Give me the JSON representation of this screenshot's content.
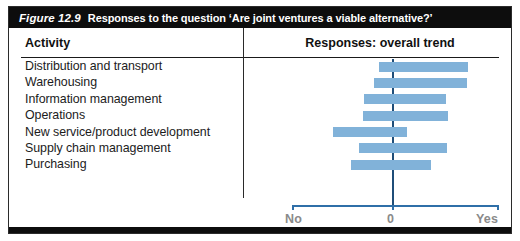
{
  "figure": {
    "number": "Figure 12.9",
    "caption": "Responses to the question ‘Are joint ventures a viable alternative?’"
  },
  "table": {
    "columns": {
      "activity": "Activity",
      "responses": "Responses: overall trend"
    }
  },
  "axis": {
    "left_label": "No",
    "center_label": "0",
    "right_label": "Yes"
  },
  "colors": {
    "bar_fill": "#81b2d9",
    "zero_line": "#1f4e79",
    "axis_line": "#2f6fa8",
    "title_bar": "#0d0d0d",
    "axis_label_text": "#8a8a8a"
  },
  "chart_data": {
    "type": "bar",
    "orientation": "horizontal",
    "title": "Responses to the question ‘Are joint ventures a viable alternative?’",
    "subtitle": "Responses: overall trend",
    "xlabel": "",
    "ylabel": "Activity",
    "xlim": [
      -100,
      100
    ],
    "grid": false,
    "legend": false,
    "axis_tick_labels": [
      "No",
      "0",
      "Yes"
    ],
    "note": "Each row is a floating range bar spanning from its 'start' (toward No) to its 'end' (toward Yes) on a -100 (No) to +100 (Yes) scale, with 0 marked by the vertical centre line.",
    "categories": [
      "Distribution and transport",
      "Warehousing",
      "Information management",
      "Operations",
      "New service/product development",
      "Supply chain management",
      "Purchasing"
    ],
    "series": [
      {
        "name": "Range start (No side)",
        "values": [
          -14,
          -19,
          -29,
          -30,
          -60,
          -34,
          -42
        ]
      },
      {
        "name": "Range end (Yes side)",
        "values": [
          71,
          70,
          50,
          52,
          13,
          51,
          36
        ]
      }
    ],
    "bars": [
      {
        "label": "Distribution and transport",
        "start": -14,
        "end": 71
      },
      {
        "label": "Warehousing",
        "start": -19,
        "end": 70
      },
      {
        "label": "Information management",
        "start": -29,
        "end": 50
      },
      {
        "label": "Operations",
        "start": -30,
        "end": 52
      },
      {
        "label": "New service/product development",
        "start": -60,
        "end": 13
      },
      {
        "label": "Supply chain management",
        "start": -34,
        "end": 51
      },
      {
        "label": "Purchasing",
        "start": -42,
        "end": 36
      }
    ]
  }
}
